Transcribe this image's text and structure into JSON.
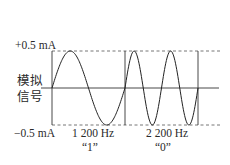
{
  "diagram": {
    "type": "waveform",
    "y_axis": {
      "top_label": "+0.5 mA",
      "bottom_label": "−0.5 mA",
      "signal_label_line1": "模拟",
      "signal_label_line2": "信号"
    },
    "segments": [
      {
        "frequency_label": "1 200 Hz",
        "bit_label": "“1”",
        "periods": 1
      },
      {
        "frequency_label": "2 200 Hz",
        "bit_label": "“0”",
        "periods": 2
      }
    ],
    "colors": {
      "line": "#333333",
      "dashed": "#666666",
      "text": "#2a2a2a"
    }
  }
}
